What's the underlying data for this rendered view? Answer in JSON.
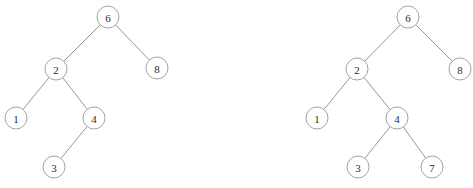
{
  "diagram": {
    "type": "binary-search-tree-pair",
    "background_color": "#ffffff",
    "node_fill_color": "#ffffff",
    "node_stroke_color": "#9a9a9a",
    "edge_color": "#8a8a8a",
    "label_color": "#2b2b2b",
    "node_radius": 11,
    "trees": [
      {
        "id": "tree-left",
        "name": "left-tree",
        "root": "6",
        "nodes": [
          {
            "id": "L6",
            "label": "6",
            "cx": 108,
            "cy": 17
          },
          {
            "id": "L2",
            "label": "2",
            "cx": 56,
            "cy": 69
          },
          {
            "id": "L8",
            "label": "8",
            "cx": 157,
            "cy": 68
          },
          {
            "id": "L1",
            "label": "1",
            "cx": 16,
            "cy": 118
          },
          {
            "id": "L4",
            "label": "4",
            "cx": 94,
            "cy": 118
          },
          {
            "id": "L3",
            "label": "3",
            "cx": 54,
            "cy": 167
          }
        ],
        "edges": [
          {
            "from": "L6",
            "to": "L2"
          },
          {
            "from": "L6",
            "to": "L8"
          },
          {
            "from": "L2",
            "to": "L1"
          },
          {
            "from": "L2",
            "to": "L4"
          },
          {
            "from": "L4",
            "to": "L3"
          }
        ]
      },
      {
        "id": "tree-right",
        "name": "right-tree",
        "root": "6",
        "nodes": [
          {
            "id": "R6",
            "label": "6",
            "cx": 408,
            "cy": 17
          },
          {
            "id": "R2",
            "label": "2",
            "cx": 357,
            "cy": 69
          },
          {
            "id": "R8",
            "label": "8",
            "cx": 460,
            "cy": 69
          },
          {
            "id": "R1",
            "label": "1",
            "cx": 317,
            "cy": 118
          },
          {
            "id": "R4",
            "label": "4",
            "cx": 397,
            "cy": 118
          },
          {
            "id": "R3",
            "label": "3",
            "cx": 358,
            "cy": 167
          },
          {
            "id": "R7",
            "label": "7",
            "cx": 432,
            "cy": 167
          }
        ],
        "edges": [
          {
            "from": "R6",
            "to": "R2"
          },
          {
            "from": "R6",
            "to": "R8"
          },
          {
            "from": "R2",
            "to": "R1"
          },
          {
            "from": "R2",
            "to": "R4"
          },
          {
            "from": "R4",
            "to": "R3"
          },
          {
            "from": "R4",
            "to": "R7"
          }
        ]
      }
    ]
  }
}
